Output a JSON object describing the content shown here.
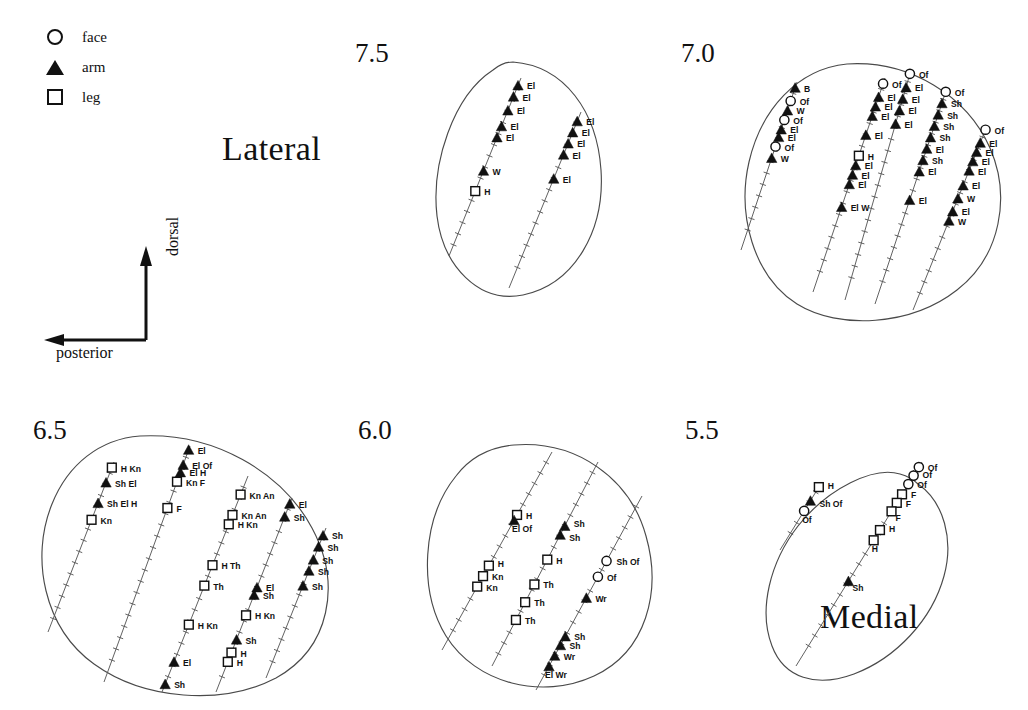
{
  "figure": {
    "legend": {
      "title": "",
      "items": [
        {
          "symbol": "circle-icon",
          "label": "face"
        },
        {
          "symbol": "triangle-icon",
          "label": "arm"
        },
        {
          "symbol": "square-icon",
          "label": "leg"
        }
      ]
    },
    "orientation": {
      "vertical_label": "dorsal",
      "horizontal_label": "posterior"
    },
    "side_labels": {
      "lateral": "Lateral",
      "medial": "Medial"
    },
    "colors": {
      "outline": "#4a4a4a",
      "track": "#5a5a5a",
      "marker_fill": "#111111",
      "background": "#ffffff"
    },
    "sections": [
      {
        "id": "s75",
        "number": "7.5"
      },
      {
        "id": "s70",
        "number": "7.0"
      },
      {
        "id": "s65",
        "number": "6.5"
      },
      {
        "id": "s60",
        "number": "6.0"
      },
      {
        "id": "s55",
        "number": "5.5"
      }
    ]
  },
  "chart_data": {
    "type": "scatter",
    "xlabel": "posterior",
    "ylabel": "dorsal",
    "legend": [
      {
        "marker": "open circle",
        "name": "face"
      },
      {
        "marker": "filled triangle",
        "name": "arm"
      },
      {
        "marker": "open square",
        "name": "leg"
      }
    ],
    "legend_position": "top-left",
    "grid": false,
    "annotations": [
      "Lateral",
      "Medial"
    ],
    "abbreviations": {
      "Of": "orofacial",
      "B": "brow",
      "W": "wrist",
      "Wr": "wrist",
      "El": "elbow",
      "Sh": "shoulder",
      "H": "hip",
      "Kn": "knee",
      "Th": "thigh",
      "F": "foot",
      "An": "ankle"
    },
    "sections": [
      {
        "label": "7.5",
        "penetrations": [
          {
            "track": 1,
            "sites": [
              {
                "type": "arm",
                "label": "El"
              },
              {
                "type": "arm",
                "label": "El"
              },
              {
                "type": "arm",
                "label": "El"
              },
              {
                "type": "arm",
                "label": "El"
              },
              {
                "type": "arm",
                "label": "El"
              },
              {
                "type": "arm",
                "label": "W"
              },
              {
                "type": "leg",
                "label": "H"
              }
            ]
          },
          {
            "track": 2,
            "sites": [
              {
                "type": "arm",
                "label": "El"
              },
              {
                "type": "arm",
                "label": "El"
              },
              {
                "type": "arm",
                "label": "El"
              },
              {
                "type": "arm",
                "label": "El"
              },
              {
                "type": "arm",
                "label": "El"
              }
            ]
          }
        ]
      },
      {
        "label": "7.0",
        "penetrations": [
          {
            "track": 1,
            "sites": [
              {
                "type": "arm",
                "label": "B"
              },
              {
                "type": "face",
                "label": "Of"
              },
              {
                "type": "arm",
                "label": "W"
              },
              {
                "type": "face",
                "label": "Of"
              },
              {
                "type": "arm",
                "label": "El"
              },
              {
                "type": "arm",
                "label": "El"
              },
              {
                "type": "face",
                "label": "Of"
              },
              {
                "type": "arm",
                "label": "W"
              }
            ]
          },
          {
            "track": 2,
            "sites": [
              {
                "type": "face",
                "label": "Of"
              },
              {
                "type": "arm",
                "label": "El"
              },
              {
                "type": "arm",
                "label": "El"
              },
              {
                "type": "arm",
                "label": "El"
              },
              {
                "type": "arm",
                "label": "El"
              },
              {
                "type": "leg",
                "label": "H"
              },
              {
                "type": "arm",
                "label": "El"
              },
              {
                "type": "arm",
                "label": "El"
              },
              {
                "type": "arm",
                "label": "El"
              },
              {
                "type": "arm",
                "label": "El W"
              }
            ]
          },
          {
            "track": 3,
            "sites": [
              {
                "type": "face",
                "label": "Of"
              },
              {
                "type": "arm",
                "label": "El"
              },
              {
                "type": "arm",
                "label": "El"
              },
              {
                "type": "arm",
                "label": "El"
              },
              {
                "type": "arm",
                "label": "El"
              }
            ]
          },
          {
            "track": 4,
            "sites": [
              {
                "type": "face",
                "label": "Of"
              },
              {
                "type": "arm",
                "label": "Sh"
              },
              {
                "type": "arm",
                "label": "Sh"
              },
              {
                "type": "arm",
                "label": "Sh"
              },
              {
                "type": "arm",
                "label": "Sh"
              },
              {
                "type": "arm",
                "label": "El"
              },
              {
                "type": "arm",
                "label": "Sh"
              },
              {
                "type": "arm",
                "label": "El"
              },
              {
                "type": "arm",
                "label": "El"
              }
            ]
          },
          {
            "track": 5,
            "sites": [
              {
                "type": "face",
                "label": "Of"
              },
              {
                "type": "arm",
                "label": "El"
              },
              {
                "type": "arm",
                "label": "El"
              },
              {
                "type": "arm",
                "label": "El"
              },
              {
                "type": "arm",
                "label": "El"
              },
              {
                "type": "arm",
                "label": "El"
              },
              {
                "type": "arm",
                "label": "W"
              },
              {
                "type": "arm",
                "label": "El"
              },
              {
                "type": "arm",
                "label": "W"
              }
            ]
          }
        ]
      },
      {
        "label": "6.5",
        "penetrations": [
          {
            "track": 1,
            "sites": [
              {
                "type": "leg",
                "label": "H Kn"
              },
              {
                "type": "arm",
                "label": "Sh El"
              },
              {
                "type": "arm",
                "label": "Sh El H"
              },
              {
                "type": "leg",
                "label": "Kn"
              }
            ]
          },
          {
            "track": 2,
            "sites": [
              {
                "type": "arm",
                "label": "El"
              },
              {
                "type": "arm",
                "label": "El Of"
              },
              {
                "type": "arm",
                "label": "El H"
              },
              {
                "type": "leg",
                "label": "Kn F"
              },
              {
                "type": "leg",
                "label": "F"
              }
            ]
          },
          {
            "track": 3,
            "sites": [
              {
                "type": "leg",
                "label": "Kn An"
              },
              {
                "type": "leg",
                "label": "Kn An"
              },
              {
                "type": "leg",
                "label": "H Kn"
              },
              {
                "type": "leg",
                "label": "H Th"
              },
              {
                "type": "leg",
                "label": "Th"
              },
              {
                "type": "leg",
                "label": "H Kn"
              },
              {
                "type": "arm",
                "label": "El"
              },
              {
                "type": "arm",
                "label": "Sh"
              }
            ]
          },
          {
            "track": 4,
            "sites": [
              {
                "type": "arm",
                "label": "El"
              },
              {
                "type": "arm",
                "label": "Sh"
              },
              {
                "type": "leg",
                "label": "H Kn"
              },
              {
                "type": "arm",
                "label": "Sh"
              },
              {
                "type": "leg",
                "label": "H"
              },
              {
                "type": "leg",
                "label": "H"
              },
              {
                "type": "arm",
                "label": "El"
              },
              {
                "type": "arm",
                "label": "Sh"
              }
            ]
          },
          {
            "track": 5,
            "sites": [
              {
                "type": "arm",
                "label": "Sh"
              },
              {
                "type": "arm",
                "label": "Sh"
              },
              {
                "type": "arm",
                "label": "Sh"
              },
              {
                "type": "arm",
                "label": "Sh"
              },
              {
                "type": "arm",
                "label": "Sh"
              }
            ]
          }
        ]
      },
      {
        "label": "6.0",
        "penetrations": [
          {
            "track": 1,
            "sites": [
              {
                "type": "leg",
                "label": "H"
              },
              {
                "type": "leg",
                "label": "Kn"
              },
              {
                "type": "leg",
                "label": "Kn"
              },
              {
                "type": "leg",
                "label": "H"
              },
              {
                "type": "arm",
                "label": "El Of"
              }
            ]
          },
          {
            "track": 2,
            "sites": [
              {
                "type": "arm",
                "label": "Sh"
              },
              {
                "type": "arm",
                "label": "Sh"
              },
              {
                "type": "leg",
                "label": "H"
              },
              {
                "type": "leg",
                "label": "Th"
              },
              {
                "type": "leg",
                "label": "Th"
              },
              {
                "type": "leg",
                "label": "Th"
              }
            ]
          },
          {
            "track": 3,
            "sites": [
              {
                "type": "face",
                "label": "Sh Of"
              },
              {
                "type": "face",
                "label": "Of"
              },
              {
                "type": "arm",
                "label": "Wr"
              },
              {
                "type": "arm",
                "label": "Sh"
              },
              {
                "type": "arm",
                "label": "Sh"
              },
              {
                "type": "arm",
                "label": "Wr"
              },
              {
                "type": "arm",
                "label": "El Wr"
              }
            ]
          }
        ]
      },
      {
        "label": "5.5",
        "penetrations": [
          {
            "track": 1,
            "sites": [
              {
                "type": "leg",
                "label": "H"
              },
              {
                "type": "arm",
                "label": "Sh Of"
              },
              {
                "type": "face",
                "label": "Of"
              }
            ]
          },
          {
            "track": 2,
            "sites": [
              {
                "type": "face",
                "label": "Of"
              },
              {
                "type": "face",
                "label": "Of"
              },
              {
                "type": "face",
                "label": "Of"
              },
              {
                "type": "leg",
                "label": "F"
              },
              {
                "type": "leg",
                "label": "F"
              },
              {
                "type": "leg",
                "label": "F"
              },
              {
                "type": "leg",
                "label": "H"
              },
              {
                "type": "leg",
                "label": "H"
              },
              {
                "type": "arm",
                "label": "Sh"
              }
            ]
          }
        ]
      }
    ]
  }
}
